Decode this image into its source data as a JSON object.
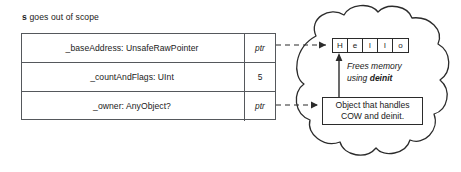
{
  "caption": {
    "variable": "s",
    "text": " goes out of scope"
  },
  "struct": {
    "rows": [
      {
        "name": "_baseAddress: UnsafeRawPointer",
        "value": "ptr",
        "value_style": "italic"
      },
      {
        "name": "_countAndFlags: UInt",
        "value": "5",
        "value_style": "normal"
      },
      {
        "name": "_owner: AnyObject?",
        "value": "ptr",
        "value_style": "italic"
      }
    ]
  },
  "heap": {
    "string_buffer": {
      "chars": [
        "H",
        "e",
        "l",
        "l",
        "o"
      ]
    },
    "frees_note": {
      "line1": "Frees memory",
      "line2_prefix": "using ",
      "line2_bold": "deinit"
    },
    "object_box": {
      "line1": "Object that handles",
      "line2": "COW and deinit."
    }
  },
  "colors": {
    "stroke": "#2b2b2b",
    "table_stroke": "#55585c",
    "text": "#1a1a1a",
    "background": "#ffffff"
  }
}
